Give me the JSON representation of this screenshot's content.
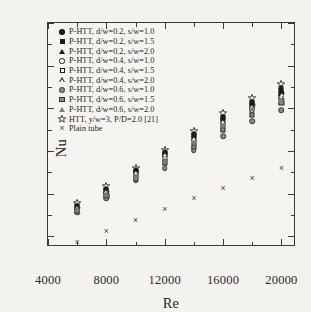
{
  "chart_data": {
    "type": "scatter",
    "title": "",
    "xlabel": "Re",
    "ylabel": "Nu",
    "xlim": [
      4000,
      21000
    ],
    "ylim": [
      15,
      120
    ],
    "x_ticks": [
      4000,
      8000,
      12000,
      16000,
      20000
    ],
    "y_ticks": [
      20,
      40,
      60,
      80,
      100,
      120
    ],
    "x_minor_step": 2000,
    "y_minor_step": 10,
    "grid": false,
    "legend_position": "upper-left",
    "x": [
      6000,
      8000,
      10000,
      12000,
      14000,
      16000,
      18000,
      20000
    ],
    "series": [
      {
        "name": "P-HTT, d/w=0.2, s/w=1.0",
        "marker": "circle-filled",
        "values": [
          33.5,
          41.0,
          50.0,
          58.0,
          66.5,
          74.5,
          81.5,
          87.0
        ]
      },
      {
        "name": "P-HTT, d/w=0.2, s/w=1.5",
        "marker": "square-filled",
        "values": [
          34.0,
          41.8,
          50.8,
          59.0,
          67.5,
          75.5,
          82.5,
          88.5
        ]
      },
      {
        "name": "P-HTT, d/w=0.2, s/w=2.0",
        "marker": "triangle-filled",
        "values": [
          34.5,
          42.5,
          51.5,
          60.0,
          68.5,
          76.5,
          83.5,
          90.0
        ]
      },
      {
        "name": "P-HTT, d/w=0.4, s/w=1.0",
        "marker": "circle-open",
        "values": [
          32.5,
          39.5,
          48.0,
          55.5,
          63.5,
          71.5,
          79.0,
          84.5
        ]
      },
      {
        "name": "P-HTT, d/w=0.4, s/w=1.5",
        "marker": "square-open",
        "values": [
          33.0,
          40.2,
          49.0,
          56.5,
          64.5,
          72.5,
          80.0,
          85.5
        ]
      },
      {
        "name": "P-HTT, d/w=0.4, s/w=2.0",
        "marker": "triangle-open",
        "values": [
          33.8,
          41.2,
          50.2,
          58.5,
          66.0,
          74.0,
          81.0,
          86.5
        ]
      },
      {
        "name": "P-HTT, d/w=0.6, s/w=1.0",
        "marker": "circle-gray",
        "values": [
          31.0,
          38.0,
          46.0,
          52.0,
          60.5,
          67.0,
          74.0,
          79.0
        ]
      },
      {
        "name": "P-HTT, d/w=0.6, s/w=1.5",
        "marker": "square-gray",
        "values": [
          32.0,
          39.0,
          47.0,
          54.5,
          62.0,
          70.0,
          77.0,
          82.5
        ]
      },
      {
        "name": "P-HTT, d/w=0.6, s/w=2.0",
        "marker": "triangle-gray",
        "values": [
          32.8,
          40.0,
          48.5,
          56.0,
          64.0,
          72.0,
          79.5,
          84.0
        ]
      },
      {
        "name": "HTT, y/w=3, P/D=2.0 [21]",
        "marker": "star-open",
        "values": [
          35.5,
          43.5,
          52.0,
          60.5,
          69.5,
          78.0,
          85.0,
          91.5
        ]
      },
      {
        "name": "Plain tube",
        "marker": "cross",
        "values": [
          17.5,
          22.5,
          27.5,
          33.0,
          38.0,
          42.5,
          47.5,
          52.0
        ]
      }
    ]
  }
}
